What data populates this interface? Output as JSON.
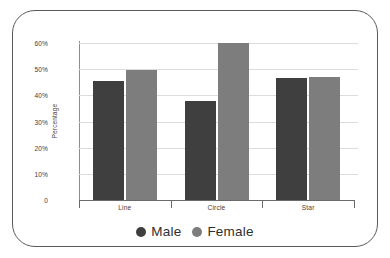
{
  "chart_data": {
    "type": "bar",
    "title": "",
    "xlabel": "",
    "ylabel": "Percentage",
    "categories": [
      "Line",
      "Circle",
      "Star"
    ],
    "series": [
      {
        "name": "Male",
        "color": "#3f3f3f",
        "values": [
          45.5,
          38,
          46.5
        ]
      },
      {
        "name": "Female",
        "color": "#7d7d7d",
        "values": [
          49.5,
          60,
          47
        ]
      }
    ],
    "ylim": [
      0,
      60
    ],
    "ytick_values": [
      0,
      10,
      20,
      30,
      40,
      50,
      60
    ],
    "ytick_labels": [
      "0",
      "10%",
      "20%",
      "30%",
      "40%",
      "50%",
      "60%"
    ],
    "grid": true,
    "legend_position": "bottom"
  },
  "legend": {
    "items": [
      {
        "label": "Male",
        "color": "#3f3f3f"
      },
      {
        "label": "Female",
        "color": "#7d7d7d"
      }
    ]
  },
  "colors": {
    "male": "#3f3f3f",
    "female": "#7d7d7d",
    "gridline": "#dcdcdc",
    "axis": "#6a6a6a",
    "card_border": "#5a5a5a",
    "background": "#ffffff",
    "text": "#3d3d3d"
  }
}
